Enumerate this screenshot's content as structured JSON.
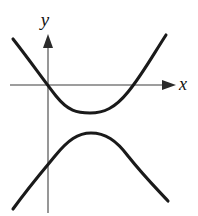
{
  "figure": {
    "background_color": "#ffffff",
    "width": 198,
    "height": 216
  },
  "axes": {
    "color": "#7d7d7d",
    "stroke_width": 1.6,
    "x_axis": {
      "label": "x",
      "label_x": 183,
      "label_y": 90,
      "line_y": 85,
      "line_x_start": 10,
      "line_x_end": 167,
      "arrow_tip_x": 176,
      "arrow_direction": "right"
    },
    "y_axis": {
      "label": "y",
      "label_x": 45,
      "label_y": 26,
      "line_x": 48,
      "line_y_start": 44,
      "line_y_end": 213,
      "arrow_tip_y": 34,
      "arrow_direction": "up"
    },
    "origin": {
      "x": 48,
      "y": 85
    }
  },
  "curves": {
    "color": "#1a1a1a",
    "stroke_width": 3.1,
    "upper_branch": {
      "name": "upper-branch",
      "opens": "up",
      "vertex": {
        "x": 90,
        "y": 113
      },
      "left_endpoint": {
        "x": 13,
        "y": 39
      },
      "right_endpoint": {
        "x": 166,
        "y": 35
      },
      "x_intercepts": [
        48,
        133
      ],
      "path": "M 13 39 C 31 62, 42 78, 56 96 C 68 111, 77 113, 90 113 C 104 113, 115 108, 128 92 C 142 75, 153 55, 166 35"
    },
    "lower_branch": {
      "name": "lower-branch",
      "opens": "down",
      "vertex": {
        "x": 91,
        "y": 133
      },
      "left_endpoint": {
        "x": 13,
        "y": 209
      },
      "right_endpoint": {
        "x": 168,
        "y": 201
      },
      "y_intercept": {
        "x": 48,
        "y": 162
      },
      "path": "M 13 209 C 28 188, 40 174, 55 156 C 68 140, 78 133, 91 133 C 105 133, 116 140, 128 156 C 143 175, 155 187, 168 201"
    }
  },
  "chart_data": {
    "type": "line",
    "xlabel": "x",
    "ylabel": "y",
    "grid": false,
    "legend": null,
    "axis_arrows": {
      "x": "right",
      "y": "up"
    },
    "series": [
      {
        "name": "upper-branch",
        "opens": "up",
        "vertex_px": [
          90,
          113
        ],
        "points_px": [
          [
            13,
            39
          ],
          [
            27,
            57
          ],
          [
            40,
            75
          ],
          [
            48,
            85
          ],
          [
            56,
            96
          ],
          [
            70,
            110
          ],
          [
            82,
            113
          ],
          [
            90,
            113
          ],
          [
            100,
            112
          ],
          [
            112,
            105
          ],
          [
            122,
            96
          ],
          [
            133,
            85
          ],
          [
            145,
            70
          ],
          [
            156,
            52
          ],
          [
            166,
            35
          ]
        ]
      },
      {
        "name": "lower-branch",
        "opens": "down",
        "vertex_px": [
          91,
          133
        ],
        "points_px": [
          [
            13,
            209
          ],
          [
            26,
            190
          ],
          [
            38,
            176
          ],
          [
            48,
            162
          ],
          [
            58,
            152
          ],
          [
            70,
            140
          ],
          [
            80,
            134
          ],
          [
            91,
            133
          ],
          [
            102,
            134
          ],
          [
            114,
            141
          ],
          [
            126,
            153
          ],
          [
            140,
            171
          ],
          [
            154,
            187
          ],
          [
            168,
            201
          ]
        ]
      }
    ]
  }
}
